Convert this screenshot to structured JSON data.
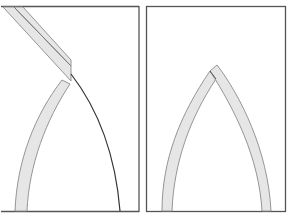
{
  "figure": {
    "panels": [
      {
        "id": "left",
        "label": "arch-with-diagonal-strut",
        "elements": [
          "diagonal-band",
          "curved-arch-band",
          "thin-dark-curve"
        ]
      },
      {
        "id": "right",
        "label": "pointed-arch",
        "elements": [
          "left-arch-band",
          "right-arch-band",
          "apex-joint"
        ]
      }
    ],
    "colors": {
      "frame": "#555555",
      "band_fill": "#e6e6e6",
      "band_stroke": "#8a8a8a",
      "curve": "#333333",
      "background": "#ffffff"
    }
  }
}
